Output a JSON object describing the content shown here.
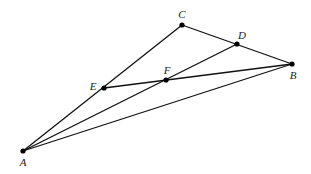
{
  "diagram": {
    "type": "geometry",
    "points": {
      "A": {
        "label": "A",
        "x": 23,
        "y": 151,
        "lx": 23,
        "ly": 166
      },
      "B": {
        "label": "B",
        "x": 292,
        "y": 64,
        "lx": 293,
        "ly": 79
      },
      "C": {
        "label": "C",
        "x": 182,
        "y": 25,
        "lx": 182,
        "ly": 18
      },
      "D": {
        "label": "D",
        "x": 237,
        "y": 44,
        "lx": 242,
        "ly": 39
      },
      "E": {
        "label": "E",
        "x": 104,
        "y": 88,
        "lx": 93,
        "ly": 90
      },
      "F": {
        "label": "F",
        "x": 166,
        "y": 80,
        "lx": 167,
        "ly": 74
      }
    },
    "segments": [
      [
        "A",
        "C"
      ],
      [
        "C",
        "B"
      ],
      [
        "A",
        "B"
      ],
      [
        "A",
        "D"
      ],
      [
        "E",
        "B"
      ]
    ],
    "colors": {
      "stroke": "#111111",
      "point": "#000000",
      "background": "#ffffff"
    }
  }
}
